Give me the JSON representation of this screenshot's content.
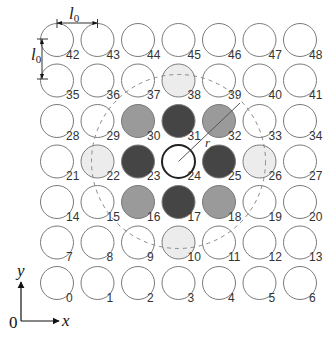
{
  "diagram": {
    "grid": {
      "cols": 7,
      "rows": 7,
      "origin_x": 57,
      "origin_y": 283,
      "spacing": 40.5,
      "radius": 16.5,
      "stroke": "#7a7a7a"
    },
    "colors": {
      "none": "#ffffff",
      "light": "#ececec",
      "medium": "#9a9a9a",
      "dark": "#454545",
      "center_stroke": "#222222",
      "label": "#333333",
      "dashed": "#8a8a8a",
      "line": "#555555"
    },
    "cells": [
      {
        "id": "0",
        "shade": "none"
      },
      {
        "id": "1",
        "shade": "none"
      },
      {
        "id": "2",
        "shade": "none"
      },
      {
        "id": "3",
        "shade": "none"
      },
      {
        "id": "4",
        "shade": "none"
      },
      {
        "id": "5",
        "shade": "none"
      },
      {
        "id": "6",
        "shade": "none"
      },
      {
        "id": "7",
        "shade": "none"
      },
      {
        "id": "8",
        "shade": "none"
      },
      {
        "id": "9",
        "shade": "none"
      },
      {
        "id": "10",
        "shade": "light"
      },
      {
        "id": "11",
        "shade": "none"
      },
      {
        "id": "12",
        "shade": "none"
      },
      {
        "id": "13",
        "shade": "none"
      },
      {
        "id": "14",
        "shade": "none"
      },
      {
        "id": "15",
        "shade": "none"
      },
      {
        "id": "16",
        "shade": "medium"
      },
      {
        "id": "17",
        "shade": "dark"
      },
      {
        "id": "18",
        "shade": "medium"
      },
      {
        "id": "19",
        "shade": "none"
      },
      {
        "id": "20",
        "shade": "none"
      },
      {
        "id": "21",
        "shade": "none"
      },
      {
        "id": "22",
        "shade": "light"
      },
      {
        "id": "23",
        "shade": "dark"
      },
      {
        "id": "24",
        "shade": "center"
      },
      {
        "id": "25",
        "shade": "dark"
      },
      {
        "id": "26",
        "shade": "light"
      },
      {
        "id": "27",
        "shade": "none"
      },
      {
        "id": "28",
        "shade": "none"
      },
      {
        "id": "29",
        "shade": "none"
      },
      {
        "id": "30",
        "shade": "medium"
      },
      {
        "id": "31",
        "shade": "dark"
      },
      {
        "id": "32",
        "shade": "medium"
      },
      {
        "id": "33",
        "shade": "none"
      },
      {
        "id": "34",
        "shade": "none"
      },
      {
        "id": "35",
        "shade": "none"
      },
      {
        "id": "36",
        "shade": "none"
      },
      {
        "id": "37",
        "shade": "none"
      },
      {
        "id": "38",
        "shade": "light"
      },
      {
        "id": "39",
        "shade": "none"
      },
      {
        "id": "40",
        "shade": "none"
      },
      {
        "id": "41",
        "shade": "none"
      },
      {
        "id": "42",
        "shade": "none"
      },
      {
        "id": "43",
        "shade": "none"
      },
      {
        "id": "44",
        "shade": "none"
      },
      {
        "id": "45",
        "shade": "none"
      },
      {
        "id": "46",
        "shade": "none"
      },
      {
        "id": "47",
        "shade": "none"
      },
      {
        "id": "48",
        "shade": "none"
      }
    ],
    "cutoff_circle": {
      "center_cell": "24",
      "radius": 87
    },
    "radius_line": {
      "label": "r",
      "subscript": "c",
      "x2": 240,
      "y2": 103
    },
    "dimension_labels": {
      "horizontal": "l",
      "horizontal_sub": "0",
      "vertical": "l",
      "vertical_sub": "0"
    },
    "axes": {
      "x_label": "x",
      "y_label": "y",
      "origin_label": "0"
    }
  }
}
